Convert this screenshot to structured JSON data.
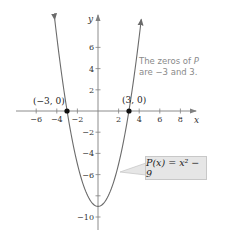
{
  "chart_data": {
    "type": "line",
    "title": "",
    "function": "P(x) = x^2 - 9",
    "xlabel": "x",
    "ylabel": "y",
    "xlim": [
      -7,
      9
    ],
    "ylim": [
      -12,
      8
    ],
    "grid": false,
    "x_ticks": [
      -6,
      -4,
      -2,
      2,
      4,
      6,
      8
    ],
    "y_ticks": [
      6,
      4,
      2,
      -2,
      -4,
      -6,
      -8,
      -10
    ],
    "x_tick_labels": [
      "−6",
      "−4",
      "−2",
      "2",
      "4",
      "6",
      "8"
    ],
    "y_tick_labels": [
      "6",
      "4",
      "2",
      "−2",
      "−4",
      "−6",
      "",
      "−10"
    ],
    "series": [
      {
        "name": "P(x) = x^2 − 9",
        "x": [
          -4.2,
          -4,
          -3.5,
          -3,
          -2.5,
          -2,
          -1.5,
          -1,
          -0.5,
          0,
          0.5,
          1,
          1.5,
          2,
          2.5,
          3,
          3.5,
          4,
          4.2
        ],
        "y": [
          8.64,
          7,
          3.25,
          0,
          -2.75,
          -5,
          -6.75,
          -8,
          -8.75,
          -9,
          -8.75,
          -8,
          -6.75,
          -5,
          -2.75,
          0,
          3.25,
          7,
          8.64
        ]
      }
    ],
    "points": [
      {
        "label": "(−3, 0)",
        "x": -3,
        "y": 0
      },
      {
        "label": "(3, 0)",
        "x": 3,
        "y": 0
      }
    ],
    "annotations": [
      {
        "text_parts": [
          "The zeros of ",
          "P",
          " are −3 and 3."
        ],
        "position": "upper-right"
      },
      {
        "text": "P(x) = x² − 9",
        "position": "lower-right",
        "style": "callout-box"
      }
    ]
  },
  "labels": {
    "x_axis": "x",
    "y_axis": "y",
    "zero_left": "(−3, 0)",
    "zero_right": "(3, 0)",
    "annotation_line1_a": "The zeros of ",
    "annotation_line1_b": "P",
    "annotation_line2": "are −3 and 3.",
    "function_label": "P(x) = x² − 9"
  },
  "colors": {
    "curve": "#6b6b6b",
    "axis": "#808080",
    "point": "#111111",
    "callout_bg": "#e6e6e6",
    "annotation_text": "#8a8a8a"
  }
}
